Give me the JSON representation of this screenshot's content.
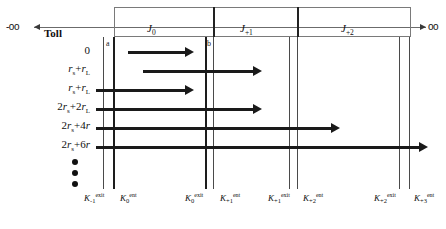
{
  "diagram": {
    "endpoints": {
      "left": "-oo",
      "right": "oo"
    },
    "toll_heading": "Toll",
    "intervals": [
      {
        "label": "J",
        "sub": "0"
      },
      {
        "label": "J",
        "sub": "+1"
      },
      {
        "label": "J",
        "sub": "+2"
      }
    ],
    "tick_markers": [
      {
        "name": "a",
        "label": "a"
      },
      {
        "name": "b",
        "label": "b"
      }
    ],
    "row_labels": [
      "0",
      "r<sub>s</sub>+r<sub>L</sub>",
      "r<sub>s</sub>+r<sub>L</sub>",
      "2r<sub>s</sub>+2r<sub>L</sub>",
      "2r<sub>s</sub>+4r",
      "2r<sub>s</sub>+6r"
    ],
    "row_labels_plain": [
      "0",
      "rs+rL",
      "rs+rL",
      "2rs+2rL",
      "2rs+4r",
      "2rs+6r"
    ],
    "ellipsis_dots": 3,
    "axis_labels": [
      {
        "base": "K",
        "sub": "-1",
        "sup": "exit"
      },
      {
        "base": "K",
        "sub": "0",
        "sup": "ent"
      },
      {
        "base": "K",
        "sub": "0",
        "sup": "exit"
      },
      {
        "base": "K",
        "sub": "+1",
        "sup": "ent"
      },
      {
        "base": "K",
        "sub": "+1",
        "sup": "exit"
      },
      {
        "base": "K",
        "sub": "+2",
        "sup": "ent"
      },
      {
        "base": "K",
        "sub": "+2",
        "sup": "exit"
      },
      {
        "base": "K",
        "sub": "+3",
        "sup": "ent"
      }
    ]
  },
  "colors": {
    "bar": "#1a1a1a",
    "grid": "#4a4a4a",
    "box": "#7a7a7a",
    "axis": "#6b6b6b"
  }
}
